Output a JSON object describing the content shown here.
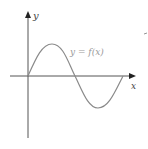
{
  "diagram": {
    "type": "function-graph",
    "axes": {
      "x_label": "x",
      "y_label": "y"
    },
    "curve": {
      "label": "y = f(x)",
      "shape": "sine-one-period",
      "color": "#888888"
    },
    "colors": {
      "axes": "#333333",
      "curve": "#888888",
      "label_curve": "#9a9a9a",
      "label_axes": "#444444"
    }
  }
}
